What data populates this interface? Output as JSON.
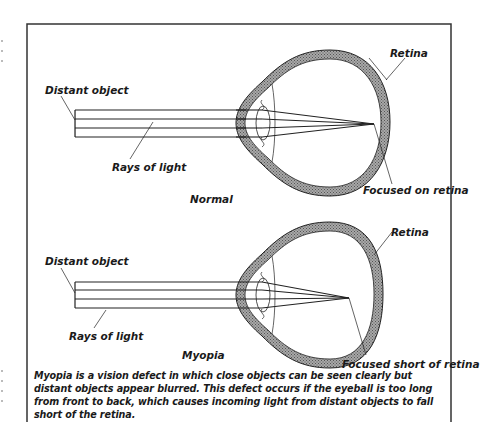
{
  "figure": {
    "type": "eye-focus-comparison",
    "frame_color": "#333333",
    "sclera_fill": "#8a8a8a"
  },
  "panels": [
    {
      "id": "normal",
      "title": "Normal",
      "labels": {
        "object": "Distant object",
        "rays": "Rays of light",
        "retina": "Retina",
        "focus": "Focused on retina"
      }
    },
    {
      "id": "myopia",
      "title": "Myopia",
      "labels": {
        "object": "Distant object",
        "rays": "Rays of light",
        "retina": "Retina",
        "focus": "Focused short of retina"
      }
    }
  ],
  "caption": "Myopia is a vision defect in which close objects can be seen clearly but distant objects appear blurred. This defect occurs if the eyeball is too long from front to back, which causes incoming light from distant objects to fall short of the retina."
}
